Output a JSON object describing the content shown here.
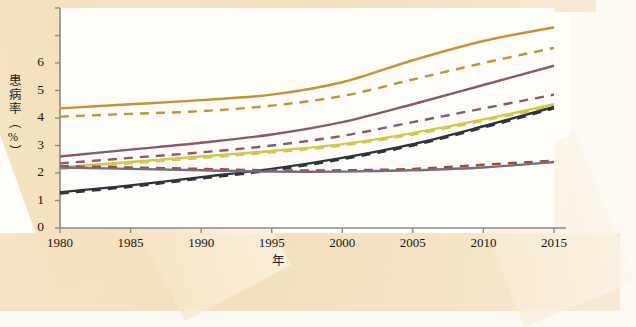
{
  "axis": {
    "ylabel": "患病率（%）",
    "xlabel": "年",
    "yticks": [
      "6",
      "5",
      "4",
      "3",
      "2",
      "1",
      "0"
    ],
    "xticks": [
      "1980",
      "1985",
      "1990",
      "1995",
      "2000",
      "2005",
      "2010",
      "2015"
    ]
  },
  "colors": {
    "orange": "#c8912f",
    "purple": "#8d5670",
    "yellow": "#d3c64a",
    "dark": "#2e3338",
    "red": "#b5442c",
    "slate": "#6d6f82",
    "axis": "#8a8a8a",
    "text": "#151515",
    "paper": "#fffdf8",
    "band": "#f4e2c2"
  },
  "chart_data": {
    "type": "line",
    "title": "",
    "xlabel": "年",
    "ylabel": "患病率（%）",
    "xlim": [
      1980,
      2015
    ],
    "ylim": [
      0,
      8
    ],
    "yticks": [
      0,
      1,
      2,
      3,
      4,
      5,
      6
    ],
    "xticks": [
      1980,
      1985,
      1990,
      1995,
      2000,
      2005,
      2010,
      2015
    ],
    "grid": false,
    "legend": "none",
    "x": [
      1980,
      1985,
      1990,
      1995,
      2000,
      2005,
      2010,
      2015
    ],
    "series": [
      {
        "name": "orange-solid",
        "color": "#c8912f",
        "style": "solid",
        "values": [
          4.35,
          4.5,
          4.65,
          4.85,
          5.3,
          6.1,
          6.8,
          7.3
        ]
      },
      {
        "name": "orange-dashed",
        "color": "#c8912f",
        "style": "dashed",
        "values": [
          4.05,
          4.15,
          4.25,
          4.45,
          4.8,
          5.4,
          6.0,
          6.55
        ]
      },
      {
        "name": "purple-solid",
        "color": "#8d5670",
        "style": "solid",
        "values": [
          2.6,
          2.85,
          3.1,
          3.4,
          3.85,
          4.5,
          5.2,
          5.9
        ]
      },
      {
        "name": "purple-dashed",
        "color": "#8d5670",
        "style": "dashed",
        "values": [
          2.35,
          2.55,
          2.75,
          3.0,
          3.35,
          3.85,
          4.35,
          4.85
        ]
      },
      {
        "name": "yellow-solid",
        "color": "#d3c64a",
        "style": "solid",
        "values": [
          2.2,
          2.4,
          2.6,
          2.8,
          3.05,
          3.45,
          3.95,
          4.5
        ]
      },
      {
        "name": "yellow-dashed",
        "color": "#d3c64a",
        "style": "dashed",
        "values": [
          2.15,
          2.35,
          2.55,
          2.75,
          3.0,
          3.4,
          3.9,
          4.45
        ]
      },
      {
        "name": "dark-solid",
        "color": "#2e3338",
        "style": "solid",
        "values": [
          1.3,
          1.55,
          1.85,
          2.15,
          2.55,
          3.05,
          3.7,
          4.4
        ]
      },
      {
        "name": "dark-dashed",
        "color": "#2e3338",
        "style": "dashed",
        "values": [
          1.25,
          1.5,
          1.8,
          2.1,
          2.5,
          3.0,
          3.65,
          4.35
        ]
      },
      {
        "name": "red-dashed",
        "color": "#b5442c",
        "style": "dashed",
        "values": [
          2.25,
          2.2,
          2.15,
          2.1,
          2.1,
          2.15,
          2.3,
          2.45
        ]
      },
      {
        "name": "slate-solid",
        "color": "#6d6f82",
        "style": "solid",
        "values": [
          2.2,
          2.15,
          2.1,
          2.05,
          2.05,
          2.1,
          2.2,
          2.4
        ]
      }
    ]
  }
}
